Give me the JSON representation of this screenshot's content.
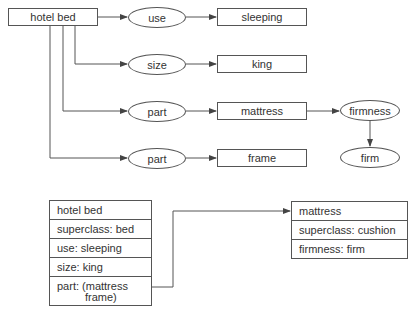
{
  "semantic_network": {
    "root": {
      "label": "hotel bed"
    },
    "relations": [
      {
        "slot": "use",
        "value": "sleeping"
      },
      {
        "slot": "size",
        "value": "king"
      },
      {
        "slot": "part",
        "value": "mattress"
      },
      {
        "slot": "part",
        "value": "frame"
      }
    ],
    "mattress_relation": {
      "slot": "firmness",
      "value": "firm"
    }
  },
  "frames": {
    "hotel_bed": {
      "rows": [
        "hotel bed",
        "superclass: bed",
        "use: sleeping",
        "size: king"
      ],
      "part_line1": "part: (mattress",
      "part_line2": "frame)"
    },
    "mattress": {
      "rows": [
        "mattress",
        "superclass: cushion",
        "firmness: firm"
      ]
    }
  },
  "colors": {
    "line": "#555555",
    "text": "#333333",
    "background": "#ffffff"
  }
}
